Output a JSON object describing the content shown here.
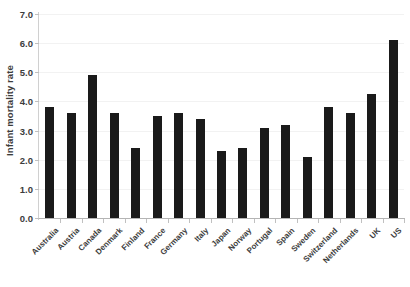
{
  "chart_data": {
    "type": "bar",
    "title": "",
    "subtitle": "",
    "xlabel": "",
    "ylabel": "Infant mortality rate",
    "ylim": [
      0.0,
      7.0
    ],
    "ytick_labels": [
      "7.0",
      "6.0",
      "5.0",
      "4.0",
      "3.0",
      "2.0",
      "1.0",
      "0.0"
    ],
    "ytick_values": [
      7.0,
      6.0,
      5.0,
      4.0,
      3.0,
      2.0,
      1.0,
      0.0
    ],
    "grid": "horizontal-faint",
    "legend": "none",
    "bar_color": "#1a1a1a",
    "categories": [
      "Australia",
      "Austria",
      "Canada",
      "Denmark",
      "Finland",
      "France",
      "Germany",
      "Italy",
      "Japan",
      "Norway",
      "Portugal",
      "Spain",
      "Sweden",
      "Switzerland",
      "Netherlands",
      "UK",
      "US"
    ],
    "values": [
      3.8,
      3.6,
      4.9,
      3.6,
      2.4,
      3.5,
      3.6,
      3.4,
      2.3,
      2.4,
      3.1,
      3.2,
      2.1,
      3.8,
      3.6,
      4.25,
      6.1
    ]
  }
}
